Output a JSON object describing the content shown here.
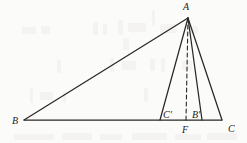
{
  "figure": {
    "background_color": "#fbfbfa",
    "stroke_color": "#2a2826",
    "label_color": "#23211f",
    "width": 247,
    "height": 143
  },
  "labels": {
    "apex": "A",
    "left_base": "B",
    "right_base": "C",
    "foot_of_altitude": "F",
    "cevian_foot_left": "C'",
    "cevian_foot_right": "B'"
  },
  "points": {
    "A": {
      "x": 188,
      "y": 18
    },
    "B": {
      "x": 24,
      "y": 120
    },
    "C": {
      "x": 222,
      "y": 120
    },
    "F": {
      "x": 186,
      "y": 120
    },
    "Cp": {
      "x": 160,
      "y": 120
    },
    "Bp": {
      "x": 202,
      "y": 120
    }
  },
  "label_positions": {
    "A": {
      "x": 183,
      "y": 2
    },
    "B": {
      "x": 12,
      "y": 116
    },
    "C": {
      "x": 228,
      "y": 124
    },
    "F": {
      "x": 182,
      "y": 125
    },
    "Cp": {
      "x": 163,
      "y": 110
    },
    "Bp": {
      "x": 192,
      "y": 110
    }
  },
  "segments": [
    {
      "name": "side-AB",
      "from": "B",
      "to": "A",
      "style": "solid"
    },
    {
      "name": "side-AC",
      "from": "A",
      "to": "C",
      "style": "solid"
    },
    {
      "name": "base-BC",
      "from": "B",
      "to": "C",
      "style": "solid"
    },
    {
      "name": "cevian-A-Cprime",
      "from": "A",
      "to": "Cp",
      "style": "solid"
    },
    {
      "name": "cevian-A-Bprime",
      "from": "A",
      "to": "Bp",
      "style": "solid"
    },
    {
      "name": "altitude-A-F",
      "from": "A",
      "to": "F",
      "style": "dashed"
    }
  ],
  "ghost_marks": [
    {
      "x": 22,
      "y": 27,
      "w": 14,
      "h": 7
    },
    {
      "x": 41,
      "y": 26,
      "w": 9,
      "h": 8
    },
    {
      "x": 93,
      "y": 22,
      "w": 5,
      "h": 13
    },
    {
      "x": 103,
      "y": 24,
      "w": 4,
      "h": 11
    },
    {
      "x": 118,
      "y": 20,
      "w": 5,
      "h": 15
    },
    {
      "x": 128,
      "y": 23,
      "w": 18,
      "h": 9
    },
    {
      "x": 152,
      "y": 10,
      "w": 3,
      "h": 16
    },
    {
      "x": 160,
      "y": 24,
      "w": 16,
      "h": 9
    },
    {
      "x": 186,
      "y": 26,
      "w": 12,
      "h": 8
    },
    {
      "x": 123,
      "y": 38,
      "w": 6,
      "h": 12
    },
    {
      "x": 57,
      "y": 60,
      "w": 4,
      "h": 13
    },
    {
      "x": 110,
      "y": 58,
      "w": 4,
      "h": 14
    },
    {
      "x": 122,
      "y": 61,
      "w": 14,
      "h": 9
    },
    {
      "x": 150,
      "y": 59,
      "w": 5,
      "h": 12
    },
    {
      "x": 161,
      "y": 58,
      "w": 4,
      "h": 14
    },
    {
      "x": 182,
      "y": 61,
      "w": 10,
      "h": 9
    },
    {
      "x": 30,
      "y": 88,
      "w": 3,
      "h": 15
    },
    {
      "x": 40,
      "y": 92,
      "w": 13,
      "h": 8
    },
    {
      "x": 63,
      "y": 91,
      "w": 3,
      "h": 12
    },
    {
      "x": 144,
      "y": 88,
      "w": 4,
      "h": 14
    },
    {
      "x": 14,
      "y": 134,
      "w": 40,
      "h": 6
    },
    {
      "x": 62,
      "y": 133,
      "w": 30,
      "h": 7
    },
    {
      "x": 100,
      "y": 134,
      "w": 22,
      "h": 6
    },
    {
      "x": 132,
      "y": 133,
      "w": 35,
      "h": 7
    },
    {
      "x": 175,
      "y": 134,
      "w": 26,
      "h": 6
    },
    {
      "x": 207,
      "y": 133,
      "w": 30,
      "h": 7
    }
  ]
}
